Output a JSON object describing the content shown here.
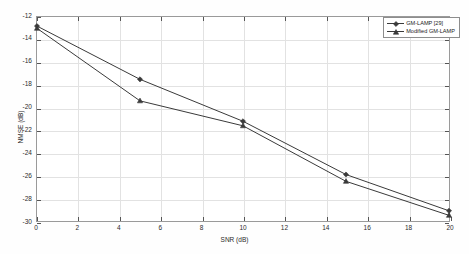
{
  "chart_data": {
    "type": "line",
    "title": "",
    "xlabel": "SNR (dB)",
    "ylabel": "NMSE (dB)",
    "xlim": [
      0,
      20
    ],
    "ylim": [
      -30,
      -12
    ],
    "xticks": [
      0,
      2,
      4,
      6,
      8,
      10,
      12,
      14,
      16,
      18,
      20
    ],
    "yticks": [
      -12,
      -14,
      -16,
      -18,
      -20,
      -22,
      -24,
      -26,
      -28,
      -30
    ],
    "xticklabels": [
      "0",
      "2",
      "4",
      "6",
      "8",
      "10",
      "12",
      "14",
      "16",
      "18",
      "20"
    ],
    "yticklabels": [
      "-12",
      "-14",
      "-16",
      "-18",
      "-20",
      "-22",
      "-24",
      "-26",
      "-28",
      "-30"
    ],
    "grid": true,
    "legend_position": "upper right",
    "x": [
      0,
      5,
      10,
      15,
      20
    ],
    "series": [
      {
        "name": "GM-LAMP [29]",
        "marker": "diamond",
        "color": "#3a3a3a",
        "values": [
          -12.8,
          -17.5,
          -21.2,
          -25.9,
          -29.1
        ]
      },
      {
        "name": "Modified GM-LAMP",
        "marker": "triangle",
        "color": "#3a3a3a",
        "values": [
          -13.0,
          -19.4,
          -21.6,
          -26.5,
          -29.5
        ]
      }
    ]
  },
  "legend": {
    "entries": [
      {
        "label": "GM-LAMP [29]"
      },
      {
        "label": "Modified GM-LAMP"
      }
    ]
  },
  "axes": {
    "x_label": "SNR (dB)",
    "y_label": "NMSE (dB)"
  }
}
